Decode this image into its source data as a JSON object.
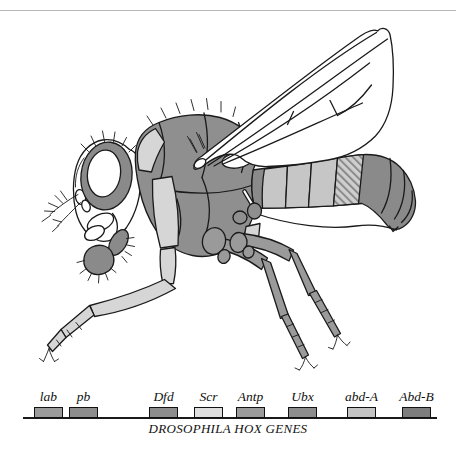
{
  "figure": {
    "caption": "DROSOPHILA HOX GENES"
  },
  "legend": {
    "caption": "DROSOPHILA HOX GENES",
    "line_color": "#1a1a1a",
    "genes": [
      {
        "label": "lab",
        "color": "#9b9b9b",
        "x": 34
      },
      {
        "label": "pb",
        "color": "#8d8d8d",
        "x": 69
      },
      {
        "label": "Dfd",
        "color": "#8d8d8d",
        "x": 149
      },
      {
        "label": "Scr",
        "color": "#dedede",
        "x": 194
      },
      {
        "label": "Antp",
        "color": "#9b9b9b",
        "x": 236
      },
      {
        "label": "Ubx",
        "color": "#8d8d8d",
        "x": 288
      },
      {
        "label": "abd-A",
        "color": "#c4c4c4",
        "x": 347
      },
      {
        "label": "Abd-B",
        "color": "#7d7d7d",
        "x": 402
      }
    ]
  },
  "fly": {
    "colors": {
      "outline": "#1a1a1a",
      "head": "#8a8a8a",
      "thorax": "#8f8f8f",
      "pale": "#d6d6d6",
      "abdomen_light": "#c6c6c6",
      "abdomen_dark": "#8a8a8a",
      "hatch_bg": "#cfcfcf",
      "hatch_line": "#8a8a8a",
      "leg": "#9a9a9a",
      "wing": "#ffffff"
    }
  }
}
